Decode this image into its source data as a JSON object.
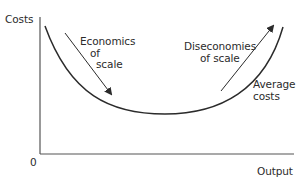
{
  "diagram": {
    "axes": {
      "y_label": "Costs",
      "x_label": "Output",
      "origin_label": "0"
    },
    "curve": {
      "label_line1": "Average",
      "label_line2": "costs",
      "shape": "U-shaped"
    },
    "annotations": {
      "economies": {
        "line1": "Economics",
        "line2": "of",
        "line3": "scale",
        "direction": "down-right"
      },
      "diseconomies": {
        "line1": "Diseconomies",
        "line2": "of scale",
        "direction": "up-right"
      }
    },
    "colors": {
      "line": "#2b2b2b",
      "axis": "#555555",
      "background": "#ffffff"
    }
  }
}
